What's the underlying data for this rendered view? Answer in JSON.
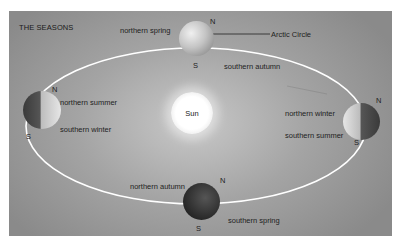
{
  "title": "THE SEASONS",
  "sun": {
    "label": "Sun"
  },
  "positions": {
    "top": {
      "north_label": "northern spring",
      "south_label": "southern autumn",
      "pole_n": "N",
      "pole_s": "S",
      "callout": "Arctic Circle"
    },
    "left": {
      "north_label": "northern summer",
      "south_label": "southern winter",
      "pole_n": "N",
      "pole_s": "S"
    },
    "right": {
      "north_label": "northern winter",
      "south_label": "southern summer",
      "pole_n": "N",
      "pole_s": "S"
    },
    "bottom": {
      "north_label": "northern autumn",
      "south_label": "southern spring",
      "pole_n": "N",
      "pole_s": "S"
    }
  },
  "colors": {
    "orbit": "#ffffff",
    "panel": "#a4a4a4",
    "text": "#1e1e1e"
  }
}
